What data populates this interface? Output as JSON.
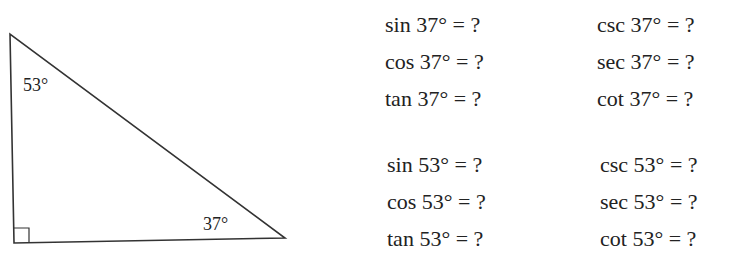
{
  "triangle": {
    "angle_top": "53°",
    "angle_bottom_right": "37°",
    "right_angle_marker": true
  },
  "equations": {
    "group_37": {
      "left": [
        "sin 37° = ?",
        "cos 37° = ?",
        "tan 37° = ?"
      ],
      "right": [
        "csc 37° = ?",
        "sec 37° = ?",
        "cot 37° = ?"
      ]
    },
    "group_53": {
      "left": [
        "sin 53° = ?",
        "cos 53° = ?",
        "tan 53° = ?"
      ],
      "right": [
        "csc 53° = ?",
        "sec 53° = ?",
        "cot 53° = ?"
      ]
    }
  }
}
